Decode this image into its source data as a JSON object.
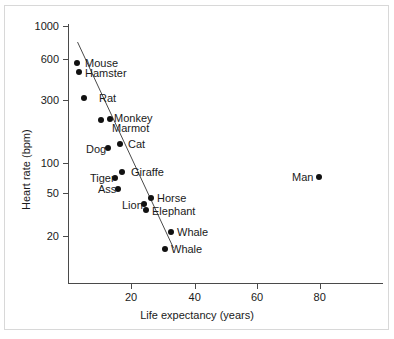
{
  "chart_data": {
    "type": "scatter",
    "title": "",
    "xlabel": "Life expectancy (years)",
    "ylabel": "Heart rate (bpm)",
    "yscale": "log",
    "xlim": [
      0,
      100
    ],
    "ylim": [
      15,
      1000
    ],
    "grid": false,
    "legend": "none",
    "xticks": [
      20,
      40,
      60,
      80
    ],
    "xtick_labels": [
      "20",
      "40",
      "60",
      "80"
    ],
    "yticks": [
      1000,
      600,
      300,
      100,
      50,
      20
    ],
    "ytick_labels": [
      "1000",
      "600",
      "300",
      "100",
      "50",
      "20"
    ],
    "marker": "filled-circle",
    "marker_color": "#111111",
    "axis_color": "#4a4a4a",
    "trendline": {
      "present": true,
      "x_start": 3.0,
      "y_start": 780,
      "x_end": 33.5,
      "y_end": 16,
      "color": "#4a4a4a"
    },
    "points": [
      {
        "name": "Mouse",
        "x": 3,
        "y": 570,
        "px": 77,
        "py": 63,
        "label_x": 85,
        "label_y": 58,
        "label_align": "left"
      },
      {
        "name": "Hamster",
        "x": 3,
        "y": 480,
        "px": 78.7,
        "py": 72.3,
        "label_x": 85,
        "label_y": 68,
        "label_align": "left"
      },
      {
        "name": "Rat",
        "x": 5,
        "y": 320,
        "px": 83.7,
        "py": 97.7,
        "label_x": 99,
        "label_y": 93,
        "label_align": "left"
      },
      {
        "name": "Marmot",
        "x": 10,
        "y": 210,
        "px": 101,
        "py": 120,
        "label_x": 112,
        "label_y": 123,
        "label_align": "left"
      },
      {
        "name": "Monkey",
        "x": 13,
        "y": 220,
        "px": 110.3,
        "py": 118.7,
        "label_x": 114,
        "label_y": 113,
        "label_align": "left"
      },
      {
        "name": "Cat",
        "x": 16,
        "y": 130,
        "px": 120,
        "py": 143.7,
        "label_x": 128,
        "label_y": 139,
        "label_align": "left"
      },
      {
        "name": "Dog",
        "x": 13,
        "y": 115,
        "px": 108.3,
        "py": 148.3,
        "label_x": 86,
        "label_y": 144,
        "label_align": "left"
      },
      {
        "name": "Giraffe",
        "x": 17,
        "y": 75,
        "px": 121.7,
        "py": 171.7,
        "label_x": 131,
        "label_y": 167,
        "label_align": "left"
      },
      {
        "name": "Tiger",
        "x": 15,
        "y": 70,
        "px": 115,
        "py": 177.7,
        "label_x": 90,
        "label_y": 173,
        "label_align": "left"
      },
      {
        "name": "Ass",
        "x": 16,
        "y": 52,
        "px": 118.3,
        "py": 189,
        "label_x": 98,
        "label_y": 184,
        "label_align": "left"
      },
      {
        "name": "Horse",
        "x": 26,
        "y": 44,
        "px": 150.7,
        "py": 197.7,
        "label_x": 157,
        "label_y": 193,
        "label_align": "left"
      },
      {
        "name": "Lion",
        "x": 24,
        "y": 40,
        "px": 144.3,
        "py": 204.3,
        "label_x": 122,
        "label_y": 200,
        "label_align": "left"
      },
      {
        "name": "Elephant",
        "x": 25,
        "y": 35,
        "px": 146,
        "py": 210,
        "label_x": 152,
        "label_y": 206,
        "label_align": "left"
      },
      {
        "name": "Whale",
        "x": 32,
        "y": 21,
        "px": 170.7,
        "py": 232.3,
        "label_x": 177,
        "label_y": 227,
        "label_align": "left"
      },
      {
        "name": "Whale",
        "x": 31,
        "y": 16,
        "px": 165,
        "py": 249.3,
        "label_x": 171,
        "label_y": 244,
        "label_align": "left"
      },
      {
        "name": "Man",
        "x": 80,
        "y": 70,
        "px": 319.3,
        "py": 177,
        "label_x": 292,
        "label_y": 172,
        "label_align": "left"
      }
    ],
    "ytick_positions": [
      {
        "value": "1000",
        "py": 26
      },
      {
        "value": "600",
        "py": 59
      },
      {
        "value": "300",
        "py": 100
      },
      {
        "value": "100",
        "py": 163
      },
      {
        "value": "50",
        "py": 193
      },
      {
        "value": "20",
        "py": 236
      }
    ],
    "xtick_positions": [
      {
        "value": "20",
        "px": 131
      },
      {
        "value": "40",
        "px": 194.7
      },
      {
        "value": "60",
        "px": 257
      },
      {
        "value": "80",
        "px": 319.7
      }
    ]
  }
}
